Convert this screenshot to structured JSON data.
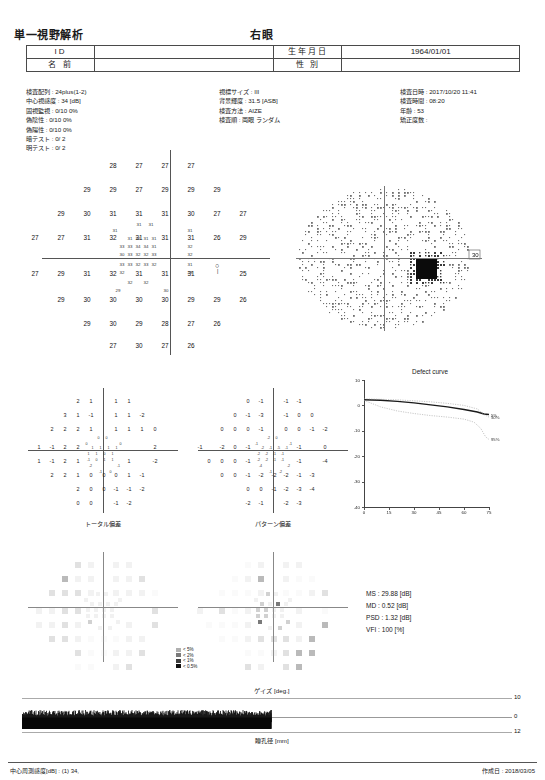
{
  "header": {
    "title": "単一視野解析",
    "eye": "右眼"
  },
  "patient": {
    "id_label": "ID",
    "id_value": "",
    "name_label": "名 前",
    "name_value": "",
    "dob_label": "生年月日",
    "dob_value": "1964/01/01",
    "sex_label": "性 別",
    "sex_value": ""
  },
  "params": {
    "col1": [
      "検査配列 : 24plus(1-2)",
      "中心視感度 : 34 [dB]",
      "固視監視 : 0/10  0%",
      "偽陰性  :  0/10  0%",
      "偽陽性  :  0/10  0%",
      "暗テスト : 0/ 2",
      "明テスト : 0/ 2"
    ],
    "col2": [
      "視標サイズ : III",
      "背景輝度 : 31.5 [ASB]",
      "検査方法 : AIZE",
      "検査順 : 両眼 ランダム"
    ],
    "col3": [
      "検査日時 : 2017/10/20 11:41",
      "検査時間 : 08:20",
      "年齢 : 53",
      "矯正度数 :"
    ]
  },
  "sensitivity": {
    "blind_spot_marker": "○",
    "rows": [
      {
        "y": 12,
        "values": [
          28,
          27,
          27,
          27
        ],
        "xs": [
          95,
          121,
          147,
          173
        ]
      },
      {
        "y": 36,
        "values": [
          29,
          29,
          27,
          29,
          29,
          29
        ],
        "xs": [
          69,
          95,
          121,
          147,
          173,
          199
        ]
      },
      {
        "y": 60,
        "values": [
          29,
          30,
          31,
          31,
          31,
          30,
          27,
          27
        ],
        "xs": [
          43,
          69,
          95,
          121,
          147,
          173,
          199,
          225
        ]
      },
      {
        "y": 84,
        "values": [
          27,
          27,
          31,
          32,
          31,
          31,
          31,
          26,
          29
        ],
        "xs": [
          17,
          43,
          69,
          95,
          121,
          147,
          173,
          199,
          225
        ]
      },
      {
        "y": 120,
        "values": [
          27,
          29,
          31,
          32,
          31,
          31,
          31,
          25
        ],
        "xs": [
          17,
          43,
          69,
          95,
          121,
          147,
          173,
          225
        ]
      },
      {
        "y": 146,
        "values": [
          29,
          30,
          30,
          30,
          30,
          29,
          29,
          26
        ],
        "xs": [
          43,
          69,
          95,
          121,
          147,
          173,
          199,
          225
        ]
      },
      {
        "y": 170,
        "values": [
          29,
          30,
          29,
          28,
          27,
          26
        ],
        "xs": [
          69,
          95,
          121,
          147,
          173,
          199
        ]
      },
      {
        "y": 192,
        "values": [
          27,
          30,
          27,
          26
        ],
        "xs": [
          95,
          121,
          147,
          173
        ]
      }
    ],
    "cluster": [
      {
        "x": 121,
        "y": 72,
        "v": 31
      },
      {
        "x": 133,
        "y": 72,
        "v": 31
      },
      {
        "x": 97,
        "y": 78,
        "v": 31
      },
      {
        "x": 172,
        "y": 78,
        "v": 31
      },
      {
        "x": 112,
        "y": 86,
        "v": 31
      },
      {
        "x": 120,
        "y": 86,
        "v": 32
      },
      {
        "x": 128,
        "y": 86,
        "v": 31
      },
      {
        "x": 136,
        "y": 86,
        "v": 31
      },
      {
        "x": 104,
        "y": 94,
        "v": 33
      },
      {
        "x": 112,
        "y": 94,
        "v": 33
      },
      {
        "x": 120,
        "y": 94,
        "v": 34
      },
      {
        "x": 128,
        "y": 94,
        "v": 34
      },
      {
        "x": 136,
        "y": 94,
        "v": 31
      },
      {
        "x": 172,
        "y": 94,
        "v": 32
      },
      {
        "x": 104,
        "y": 102,
        "v": 30
      },
      {
        "x": 112,
        "y": 102,
        "v": 33
      },
      {
        "x": 120,
        "y": 102,
        "v": 32
      },
      {
        "x": 128,
        "y": 102,
        "v": 32
      },
      {
        "x": 136,
        "y": 102,
        "v": 33
      },
      {
        "x": 172,
        "y": 102,
        "v": 32
      },
      {
        "x": 104,
        "y": 112,
        "v": 33
      },
      {
        "x": 112,
        "y": 112,
        "v": 33
      },
      {
        "x": 120,
        "y": 112,
        "v": 32
      },
      {
        "x": 128,
        "y": 112,
        "v": 33
      },
      {
        "x": 136,
        "y": 112,
        "v": 32
      },
      {
        "x": 172,
        "y": 112,
        "v": 31
      },
      {
        "x": 104,
        "y": 120,
        "v": 32
      },
      {
        "x": 172,
        "y": 120,
        "v": 28
      },
      {
        "x": 112,
        "y": 130,
        "v": 32
      },
      {
        "x": 128,
        "y": 130,
        "v": 32
      },
      {
        "x": 100,
        "y": 138,
        "v": 29
      },
      {
        "x": 148,
        "y": 138,
        "v": 30
      }
    ]
  },
  "grayscale": {
    "scale_value": "30"
  },
  "total_deviation": {
    "label": "トータル偏差",
    "rows": [
      {
        "y": 10,
        "values": [
          2,
          1,
          1,
          1
        ],
        "xs": [
          50,
          63,
          88,
          101
        ]
      },
      {
        "y": 24,
        "values": [
          3,
          1,
          -1,
          1,
          1,
          -2
        ],
        "xs": [
          37,
          50,
          63,
          88,
          101,
          114
        ]
      },
      {
        "y": 38,
        "values": [
          2,
          2,
          2,
          1,
          1,
          1,
          1,
          0
        ],
        "xs": [
          24,
          37,
          50,
          63,
          88,
          101,
          114,
          127
        ]
      },
      {
        "y": 56,
        "values": [
          1,
          -1,
          2,
          2,
          2
        ],
        "xs": [
          11,
          24,
          37,
          50,
          127
        ]
      },
      {
        "y": 70,
        "values": [
          1,
          -1,
          2,
          1,
          1,
          -2
        ],
        "xs": [
          11,
          24,
          37,
          50,
          101,
          127
        ]
      },
      {
        "y": 84,
        "values": [
          2,
          2,
          1,
          0,
          0,
          0,
          1,
          -1
        ],
        "xs": [
          24,
          37,
          50,
          63,
          76,
          88,
          101,
          114
        ]
      },
      {
        "y": 98,
        "values": [
          2,
          0,
          0,
          -1,
          -1,
          -2
        ],
        "xs": [
          50,
          63,
          76,
          88,
          101,
          114
        ]
      },
      {
        "y": 112,
        "values": [
          0,
          0,
          -1,
          -2
        ],
        "xs": [
          50,
          63,
          88,
          101
        ]
      }
    ],
    "cluster": [
      {
        "x": 70,
        "y": 48,
        "v": 0
      },
      {
        "x": 78,
        "y": 48,
        "v": 0
      },
      {
        "x": 58,
        "y": 54,
        "v": 0
      },
      {
        "x": 92,
        "y": 54,
        "v": 0
      },
      {
        "x": 64,
        "y": 58,
        "v": 1
      },
      {
        "x": 72,
        "y": 58,
        "v": 1
      },
      {
        "x": 80,
        "y": 58,
        "v": 1
      },
      {
        "x": 88,
        "y": 58,
        "v": 1
      },
      {
        "x": 60,
        "y": 64,
        "v": 1
      },
      {
        "x": 68,
        "y": 64,
        "v": 1
      },
      {
        "x": 76,
        "y": 64,
        "v": 0
      },
      {
        "x": 84,
        "y": 64,
        "v": 1
      },
      {
        "x": 60,
        "y": 70,
        "v": -1
      },
      {
        "x": 68,
        "y": 70,
        "v": 0
      },
      {
        "x": 76,
        "y": 70,
        "v": 1
      },
      {
        "x": 84,
        "y": 70,
        "v": 1
      },
      {
        "x": 62,
        "y": 76,
        "v": -2
      },
      {
        "x": 90,
        "y": 76,
        "v": -1
      },
      {
        "x": 72,
        "y": 82,
        "v": -1
      },
      {
        "x": 82,
        "y": 82,
        "v": 0
      }
    ]
  },
  "pattern_deviation": {
    "label": "パターン偏差",
    "rows": [
      {
        "y": 10,
        "values": [
          0,
          -1,
          -1,
          -1
        ],
        "xs": [
          50,
          63,
          88,
          101
        ]
      },
      {
        "y": 24,
        "values": [
          0,
          -1,
          -3,
          -1,
          0,
          0
        ],
        "xs": [
          37,
          50,
          63,
          88,
          101,
          114
        ]
      },
      {
        "y": 38,
        "values": [
          0,
          0,
          0,
          -1,
          0,
          0,
          -1,
          -2
        ],
        "xs": [
          24,
          37,
          50,
          63,
          88,
          101,
          114,
          127
        ]
      },
      {
        "y": 56,
        "values": [
          -1,
          -2,
          0,
          -1,
          -1,
          0
        ],
        "xs": [
          2,
          24,
          37,
          50,
          101,
          127
        ]
      },
      {
        "y": 70,
        "values": [
          0,
          0,
          0,
          -1,
          -1,
          -4
        ],
        "xs": [
          11,
          24,
          37,
          50,
          101,
          127
        ]
      },
      {
        "y": 84,
        "values": [
          0,
          0,
          -1,
          -2,
          -2,
          -2,
          -1,
          -3
        ],
        "xs": [
          24,
          37,
          50,
          63,
          76,
          88,
          101,
          114
        ]
      },
      {
        "y": 98,
        "values": [
          0,
          0,
          -1,
          -2,
          -3,
          -4
        ],
        "xs": [
          50,
          63,
          76,
          88,
          101,
          114
        ]
      },
      {
        "y": 112,
        "values": [
          -2,
          -1,
          -2,
          -3
        ],
        "xs": [
          50,
          63,
          88,
          101
        ]
      }
    ],
    "cluster": [
      {
        "x": 70,
        "y": 48,
        "v": -2
      },
      {
        "x": 78,
        "y": 48,
        "v": 0
      },
      {
        "x": 58,
        "y": 54,
        "v": -1
      },
      {
        "x": 92,
        "y": 54,
        "v": -1
      },
      {
        "x": 64,
        "y": 58,
        "v": -2
      },
      {
        "x": 72,
        "y": 58,
        "v": -1
      },
      {
        "x": 80,
        "y": 58,
        "v": -5
      },
      {
        "x": 88,
        "y": 58,
        "v": -1
      },
      {
        "x": 60,
        "y": 64,
        "v": -2
      },
      {
        "x": 68,
        "y": 64,
        "v": -2
      },
      {
        "x": 76,
        "y": 64,
        "v": -1
      },
      {
        "x": 84,
        "y": 64,
        "v": -1
      },
      {
        "x": 60,
        "y": 70,
        "v": -2
      },
      {
        "x": 68,
        "y": 70,
        "v": -2
      },
      {
        "x": 76,
        "y": 70,
        "v": -1
      },
      {
        "x": 84,
        "y": 70,
        "v": -1
      },
      {
        "x": 62,
        "y": 76,
        "v": -4
      },
      {
        "x": 90,
        "y": 76,
        "v": -2
      },
      {
        "x": 72,
        "y": 82,
        "v": -1
      },
      {
        "x": 82,
        "y": 82,
        "v": -2
      }
    ]
  },
  "probability_legend": [
    {
      "level": "< 5%",
      "color": "#b0b0b0"
    },
    {
      "level": "< 2%",
      "color": "#7a7a7a"
    },
    {
      "level": "< 1%",
      "color": "#3d3d3d"
    },
    {
      "level": "< 0.5%",
      "color": "#111111"
    }
  ],
  "chart_data": {
    "type": "line",
    "title": "Defect curve",
    "xlabel": "",
    "ylabel": "",
    "xlim": [
      0,
      75
    ],
    "ylim": [
      -40,
      10
    ],
    "xticks": [
      0,
      15,
      30,
      45,
      60,
      75
    ],
    "yticks": [
      10,
      0,
      -10,
      -20,
      -30,
      -40
    ],
    "grid": false,
    "legend_position": "inline-right",
    "series": [
      {
        "name": "patient",
        "annotation": "5%",
        "color": "#1a1a1a",
        "x": [
          0,
          10,
          20,
          30,
          40,
          50,
          60,
          68,
          72,
          75
        ],
        "y": [
          2.2,
          2.0,
          1.6,
          1.0,
          0.2,
          -0.6,
          -1.6,
          -2.6,
          -3.4,
          -3.6
        ]
      },
      {
        "name": "50%",
        "annotation": "50%",
        "color": "#9a9a9a",
        "x": [
          0,
          10,
          20,
          30,
          40,
          50,
          60,
          68,
          72,
          75
        ],
        "y": [
          2.6,
          2.4,
          2.2,
          1.8,
          1.4,
          0.8,
          0.0,
          -1.4,
          -3.6,
          -4.6
        ]
      },
      {
        "name": "95%",
        "annotation": "95%",
        "color": "#9a9a9a",
        "x": [
          0,
          10,
          20,
          30,
          40,
          50,
          60,
          66,
          70,
          73,
          75
        ],
        "y": [
          2.0,
          -0.6,
          -2.2,
          -3.2,
          -4.0,
          -4.6,
          -5.4,
          -6.6,
          -9.0,
          -12.4,
          -13.4
        ]
      }
    ]
  },
  "stats": {
    "ms": "MS : 29.88 [dB]",
    "md": "MD : 0.52 [dB]",
    "psd": "PSD : 1.32 [dB]",
    "vfi": "VFI : 100 [%]"
  },
  "gaze": {
    "top_label": "ゲイズ [deg.]",
    "bottom_label": "瞳孔径 [mm]",
    "tick_top": "10",
    "tick_mid": "0",
    "tick_bottom": "12"
  },
  "footer": {
    "left": "中心周測感度[dB] :  (1) 34,",
    "right": "作成日 : 2018/03/05"
  }
}
